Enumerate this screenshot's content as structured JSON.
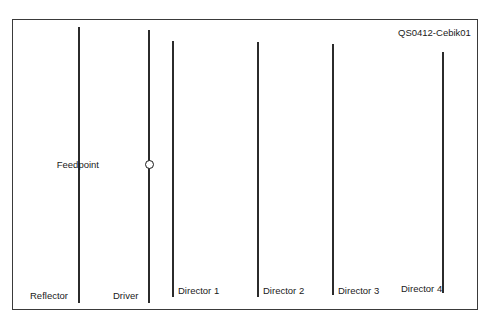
{
  "diagram": {
    "title": "QS0412-Cebik01",
    "frame": {
      "x": 12,
      "y": 19,
      "width": 466,
      "height": 291
    },
    "elements": [
      {
        "name": "Reflector",
        "x": 78,
        "top": 27,
        "bottom": 303,
        "label_x": 30,
        "label_y": 290
      },
      {
        "name": "Driver",
        "x": 148,
        "top": 30,
        "bottom": 303,
        "label_x": 113,
        "label_y": 290
      },
      {
        "name": "Director 1",
        "x": 172,
        "top": 41,
        "bottom": 297,
        "label_x": 178,
        "label_y": 285
      },
      {
        "name": "Director 2",
        "x": 257,
        "top": 42,
        "bottom": 297,
        "label_x": 263,
        "label_y": 285
      },
      {
        "name": "Director 3",
        "x": 332,
        "top": 44,
        "bottom": 295,
        "label_x": 338,
        "label_y": 285
      },
      {
        "name": "Director 4",
        "x": 442,
        "top": 52,
        "bottom": 293,
        "label_x": 401,
        "label_y": 283
      }
    ],
    "feedpoint": {
      "label": "Feedpoint",
      "label_x": 99,
      "label_y": 159,
      "marker_x": 148,
      "marker_y": 164
    }
  }
}
